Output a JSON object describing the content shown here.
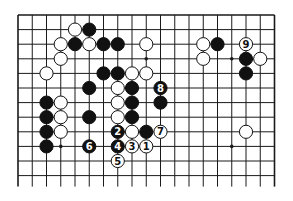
{
  "diagram": {
    "type": "go-board-partial",
    "board": {
      "columns": 19,
      "visible_rows": 12,
      "origin_x": 18,
      "origin_y": 15,
      "spacing_x": 14.25,
      "spacing_y": 14.6,
      "bottom_line_extension": 11,
      "top_edge": true,
      "left_edge": true,
      "right_edge": true,
      "bottom_edge": false,
      "line_color": "#1a1a1a",
      "star_points": [
        [
          3,
          3
        ],
        [
          9,
          3
        ],
        [
          15,
          3
        ],
        [
          3,
          9
        ],
        [
          9,
          9
        ],
        [
          15,
          9
        ]
      ]
    },
    "stones": [
      {
        "color": "white",
        "col": 4,
        "row": 1
      },
      {
        "color": "black",
        "col": 5,
        "row": 1
      },
      {
        "color": "white",
        "col": 3,
        "row": 2
      },
      {
        "color": "black",
        "col": 4,
        "row": 2
      },
      {
        "color": "white",
        "col": 5,
        "row": 2
      },
      {
        "color": "black",
        "col": 6,
        "row": 2
      },
      {
        "color": "black",
        "col": 7,
        "row": 2
      },
      {
        "color": "white",
        "col": 9,
        "row": 2
      },
      {
        "color": "white",
        "col": 13,
        "row": 2
      },
      {
        "color": "black",
        "col": 14,
        "row": 2
      },
      {
        "color": "white",
        "col": 16,
        "row": 2,
        "label": "9"
      },
      {
        "color": "white",
        "col": 3,
        "row": 3
      },
      {
        "color": "white",
        "col": 13,
        "row": 3
      },
      {
        "color": "black",
        "col": 16,
        "row": 3
      },
      {
        "color": "white",
        "col": 17,
        "row": 3
      },
      {
        "color": "white",
        "col": 2,
        "row": 4
      },
      {
        "color": "black",
        "col": 6,
        "row": 4
      },
      {
        "color": "black",
        "col": 7,
        "row": 4
      },
      {
        "color": "white",
        "col": 8,
        "row": 4
      },
      {
        "color": "white",
        "col": 9,
        "row": 4
      },
      {
        "color": "black",
        "col": 16,
        "row": 4
      },
      {
        "color": "black",
        "col": 5,
        "row": 5
      },
      {
        "color": "white",
        "col": 7,
        "row": 5
      },
      {
        "color": "black",
        "col": 8,
        "row": 5
      },
      {
        "color": "black",
        "col": 10,
        "row": 5,
        "label": "8"
      },
      {
        "color": "black",
        "col": 2,
        "row": 6
      },
      {
        "color": "white",
        "col": 3,
        "row": 6
      },
      {
        "color": "white",
        "col": 7,
        "row": 6
      },
      {
        "color": "black",
        "col": 8,
        "row": 6
      },
      {
        "color": "black",
        "col": 10,
        "row": 6
      },
      {
        "color": "black",
        "col": 2,
        "row": 7
      },
      {
        "color": "white",
        "col": 3,
        "row": 7
      },
      {
        "color": "black",
        "col": 5,
        "row": 7
      },
      {
        "color": "white",
        "col": 7,
        "row": 7
      },
      {
        "color": "black",
        "col": 8,
        "row": 7
      },
      {
        "color": "black",
        "col": 2,
        "row": 8
      },
      {
        "color": "white",
        "col": 3,
        "row": 8
      },
      {
        "color": "black",
        "col": 7,
        "row": 8,
        "label": "2"
      },
      {
        "color": "white",
        "col": 8,
        "row": 8
      },
      {
        "color": "black",
        "col": 9,
        "row": 8
      },
      {
        "color": "white",
        "col": 10,
        "row": 8,
        "label": "7"
      },
      {
        "color": "white",
        "col": 16,
        "row": 8
      },
      {
        "color": "black",
        "col": 2,
        "row": 9
      },
      {
        "color": "black",
        "col": 5,
        "row": 9,
        "label": "6"
      },
      {
        "color": "black",
        "col": 7,
        "row": 9,
        "label": "4"
      },
      {
        "color": "white",
        "col": 8,
        "row": 9,
        "label": "3"
      },
      {
        "color": "white",
        "col": 9,
        "row": 9,
        "label": "1"
      },
      {
        "color": "white",
        "col": 7,
        "row": 10,
        "label": "5"
      }
    ],
    "move_sequence": [
      "1",
      "2",
      "3",
      "4",
      "5",
      "6",
      "7",
      "8",
      "9"
    ],
    "colors": {
      "black_stone": "#111111",
      "white_stone": "#ffffff",
      "stone_outline": "#111111",
      "label_on_black": "#ffffff",
      "label_on_white": "#111111"
    }
  }
}
